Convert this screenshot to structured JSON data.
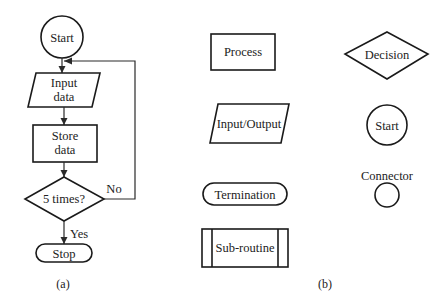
{
  "panel_a": {
    "caption": "(a)",
    "start": "Start",
    "input_line1": "Input",
    "input_line2": "data",
    "store_line1": "Store",
    "store_line2": "data",
    "decision": "5 times?",
    "no_label": "No",
    "yes_label": "Yes",
    "stop": "Stop"
  },
  "panel_b": {
    "caption": "(b)",
    "process": "Process",
    "input_output": "Input/Output",
    "termination": "Termination",
    "subroutine": "Sub-routine",
    "decision": "Decision",
    "start": "Start",
    "connector": "Connector"
  },
  "colors": {
    "stroke": "#1a1a1a",
    "background": "#ffffff"
  }
}
